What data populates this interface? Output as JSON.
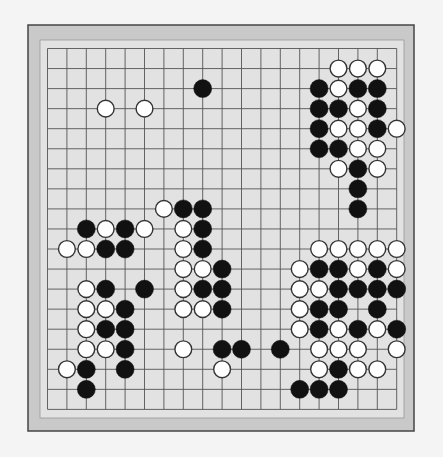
{
  "board": {
    "size": 19,
    "colors": {
      "page": "#f4f4f4",
      "frame": "#c9c9c9",
      "frame_border": "#444444",
      "surface": "#e2e2e2",
      "grid": "#555555",
      "black": "#111111",
      "white": "#ffffff",
      "white_stroke": "#333333"
    },
    "geometry": {
      "frame_x": 28,
      "frame_y": 25,
      "frame_w": 386,
      "frame_h": 406,
      "surface_x": 40,
      "surface_y": 40,
      "surface_w": 364,
      "surface_h": 378,
      "grid_x0": 47.5,
      "grid_y0": 48.5,
      "dx": 19.4,
      "dy": 20.05,
      "stone_r": 9
    },
    "stones": [
      {
        "c": "W",
        "row": 1,
        "col": 15
      },
      {
        "c": "W",
        "row": 1,
        "col": 16
      },
      {
        "c": "W",
        "row": 1,
        "col": 17
      },
      {
        "c": "B",
        "row": 2,
        "col": 8
      },
      {
        "c": "B",
        "row": 2,
        "col": 14
      },
      {
        "c": "W",
        "row": 2,
        "col": 15
      },
      {
        "c": "B",
        "row": 2,
        "col": 16
      },
      {
        "c": "B",
        "row": 2,
        "col": 17
      },
      {
        "c": "W",
        "row": 3,
        "col": 3
      },
      {
        "c": "W",
        "row": 3,
        "col": 5
      },
      {
        "c": "B",
        "row": 3,
        "col": 14
      },
      {
        "c": "B",
        "row": 3,
        "col": 15
      },
      {
        "c": "W",
        "row": 3,
        "col": 16
      },
      {
        "c": "B",
        "row": 3,
        "col": 17
      },
      {
        "c": "B",
        "row": 4,
        "col": 14
      },
      {
        "c": "W",
        "row": 4,
        "col": 15
      },
      {
        "c": "W",
        "row": 4,
        "col": 16
      },
      {
        "c": "B",
        "row": 4,
        "col": 17
      },
      {
        "c": "W",
        "row": 4,
        "col": 18
      },
      {
        "c": "B",
        "row": 5,
        "col": 14
      },
      {
        "c": "B",
        "row": 5,
        "col": 15
      },
      {
        "c": "W",
        "row": 5,
        "col": 16
      },
      {
        "c": "W",
        "row": 5,
        "col": 17
      },
      {
        "c": "W",
        "row": 6,
        "col": 15
      },
      {
        "c": "B",
        "row": 6,
        "col": 16
      },
      {
        "c": "W",
        "row": 6,
        "col": 17
      },
      {
        "c": "B",
        "row": 7,
        "col": 16
      },
      {
        "c": "W",
        "row": 8,
        "col": 6
      },
      {
        "c": "B",
        "row": 8,
        "col": 7
      },
      {
        "c": "B",
        "row": 8,
        "col": 8
      },
      {
        "c": "B",
        "row": 8,
        "col": 16
      },
      {
        "c": "B",
        "row": 9,
        "col": 2
      },
      {
        "c": "W",
        "row": 9,
        "col": 3
      },
      {
        "c": "B",
        "row": 9,
        "col": 4
      },
      {
        "c": "W",
        "row": 9,
        "col": 5
      },
      {
        "c": "W",
        "row": 9,
        "col": 7
      },
      {
        "c": "B",
        "row": 9,
        "col": 8
      },
      {
        "c": "W",
        "row": 10,
        "col": 1
      },
      {
        "c": "W",
        "row": 10,
        "col": 2
      },
      {
        "c": "B",
        "row": 10,
        "col": 3
      },
      {
        "c": "B",
        "row": 10,
        "col": 4
      },
      {
        "c": "W",
        "row": 10,
        "col": 7
      },
      {
        "c": "B",
        "row": 10,
        "col": 8
      },
      {
        "c": "W",
        "row": 10,
        "col": 14
      },
      {
        "c": "W",
        "row": 10,
        "col": 15
      },
      {
        "c": "W",
        "row": 10,
        "col": 16
      },
      {
        "c": "W",
        "row": 10,
        "col": 17
      },
      {
        "c": "W",
        "row": 10,
        "col": 18
      },
      {
        "c": "W",
        "row": 11,
        "col": 7
      },
      {
        "c": "W",
        "row": 11,
        "col": 8
      },
      {
        "c": "B",
        "row": 11,
        "col": 9
      },
      {
        "c": "W",
        "row": 11,
        "col": 13
      },
      {
        "c": "B",
        "row": 11,
        "col": 14
      },
      {
        "c": "B",
        "row": 11,
        "col": 15
      },
      {
        "c": "W",
        "row": 11,
        "col": 16
      },
      {
        "c": "B",
        "row": 11,
        "col": 17
      },
      {
        "c": "W",
        "row": 11,
        "col": 18
      },
      {
        "c": "W",
        "row": 12,
        "col": 2
      },
      {
        "c": "B",
        "row": 12,
        "col": 3
      },
      {
        "c": "B",
        "row": 12,
        "col": 5
      },
      {
        "c": "W",
        "row": 12,
        "col": 7
      },
      {
        "c": "B",
        "row": 12,
        "col": 8
      },
      {
        "c": "B",
        "row": 12,
        "col": 9
      },
      {
        "c": "W",
        "row": 12,
        "col": 13
      },
      {
        "c": "W",
        "row": 12,
        "col": 14
      },
      {
        "c": "B",
        "row": 12,
        "col": 15
      },
      {
        "c": "B",
        "row": 12,
        "col": 16
      },
      {
        "c": "B",
        "row": 12,
        "col": 17
      },
      {
        "c": "B",
        "row": 12,
        "col": 18
      },
      {
        "c": "W",
        "row": 13,
        "col": 2
      },
      {
        "c": "W",
        "row": 13,
        "col": 3
      },
      {
        "c": "B",
        "row": 13,
        "col": 4
      },
      {
        "c": "W",
        "row": 13,
        "col": 7
      },
      {
        "c": "W",
        "row": 13,
        "col": 8
      },
      {
        "c": "B",
        "row": 13,
        "col": 9
      },
      {
        "c": "W",
        "row": 13,
        "col": 13
      },
      {
        "c": "B",
        "row": 13,
        "col": 14
      },
      {
        "c": "B",
        "row": 13,
        "col": 15
      },
      {
        "c": "B",
        "row": 13,
        "col": 17
      },
      {
        "c": "W",
        "row": 14,
        "col": 2
      },
      {
        "c": "B",
        "row": 14,
        "col": 3
      },
      {
        "c": "B",
        "row": 14,
        "col": 4
      },
      {
        "c": "W",
        "row": 14,
        "col": 13
      },
      {
        "c": "B",
        "row": 14,
        "col": 14
      },
      {
        "c": "W",
        "row": 14,
        "col": 15
      },
      {
        "c": "B",
        "row": 14,
        "col": 16
      },
      {
        "c": "W",
        "row": 14,
        "col": 17
      },
      {
        "c": "B",
        "row": 14,
        "col": 18
      },
      {
        "c": "W",
        "row": 15,
        "col": 2
      },
      {
        "c": "W",
        "row": 15,
        "col": 3
      },
      {
        "c": "B",
        "row": 15,
        "col": 4
      },
      {
        "c": "W",
        "row": 15,
        "col": 7
      },
      {
        "c": "B",
        "row": 15,
        "col": 9
      },
      {
        "c": "B",
        "row": 15,
        "col": 10
      },
      {
        "c": "B",
        "row": 15,
        "col": 12
      },
      {
        "c": "W",
        "row": 15,
        "col": 14
      },
      {
        "c": "W",
        "row": 15,
        "col": 15
      },
      {
        "c": "W",
        "row": 15,
        "col": 16
      },
      {
        "c": "W",
        "row": 15,
        "col": 18
      },
      {
        "c": "W",
        "row": 16,
        "col": 1
      },
      {
        "c": "B",
        "row": 16,
        "col": 2
      },
      {
        "c": "B",
        "row": 16,
        "col": 4
      },
      {
        "c": "W",
        "row": 16,
        "col": 9
      },
      {
        "c": "W",
        "row": 16,
        "col": 14
      },
      {
        "c": "B",
        "row": 16,
        "col": 15
      },
      {
        "c": "W",
        "row": 16,
        "col": 16
      },
      {
        "c": "W",
        "row": 16,
        "col": 17
      },
      {
        "c": "B",
        "row": 17,
        "col": 2
      },
      {
        "c": "B",
        "row": 17,
        "col": 13
      },
      {
        "c": "B",
        "row": 17,
        "col": 14
      },
      {
        "c": "B",
        "row": 17,
        "col": 15
      }
    ]
  }
}
